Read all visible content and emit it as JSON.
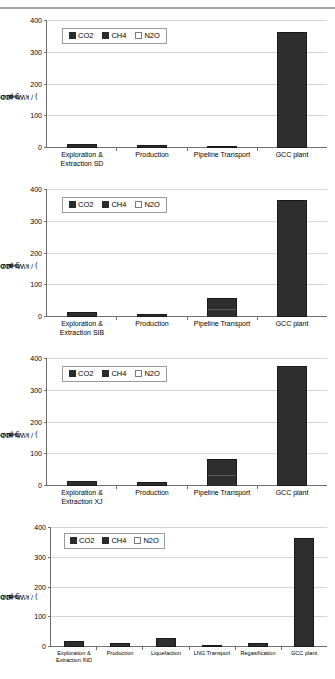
{
  "document": {
    "type": "figure-page",
    "background": "#ffffff",
    "artifact": "scan-line-top"
  },
  "axis": {
    "ylabel_pre": "g (CO",
    "ylabel_sub": "2",
    "ylabel_eq": "-equiv.",
    "ylabel_post": ") / kWh at busbar",
    "yticks": [
      "400",
      "300",
      "200",
      "100",
      "0"
    ],
    "ymin": 0,
    "ymax": 400
  },
  "legend": {
    "items": [
      {
        "label": "CO2",
        "marker": "filled-square",
        "color": "#2b2b2b"
      },
      {
        "label": "CH4",
        "marker": "filled-square",
        "color": "#2b2b2b"
      },
      {
        "label": "N2O",
        "marker": "open-square",
        "color": "#ffffff"
      }
    ]
  },
  "chart_data": [
    {
      "type": "bar",
      "id": "chart-sd",
      "title": "",
      "xlabel": "",
      "ylabel": "g (CO2-equiv.) / kWh at busbar",
      "ylim": [
        0,
        400
      ],
      "yticks": [
        0,
        100,
        200,
        300,
        400
      ],
      "grid": true,
      "legend": [
        "CO2",
        "CH4",
        "N2O"
      ],
      "legend_position": "upper-left",
      "categories": [
        "Exploration & Extraction SD",
        "Production",
        "Pipeline Transport",
        "GCC plant"
      ],
      "values": [
        8,
        6,
        2,
        360
      ],
      "series": [
        {
          "name": "CO2",
          "values": [
            4,
            4,
            1,
            359
          ]
        },
        {
          "name": "CH4",
          "values": [
            4,
            2,
            1,
            1
          ]
        },
        {
          "name": "N2O",
          "values": [
            0,
            0,
            0,
            0
          ]
        }
      ]
    },
    {
      "type": "bar",
      "id": "chart-sib",
      "title": "",
      "xlabel": "",
      "ylabel": "g (CO2-equiv.) / kWh at busbar",
      "ylim": [
        0,
        400
      ],
      "yticks": [
        0,
        100,
        200,
        300,
        400
      ],
      "grid": true,
      "legend": [
        "CO2",
        "CH4",
        "N2O"
      ],
      "legend_position": "upper-left",
      "categories": [
        "Exploration & Extraction SIB",
        "Production",
        "Pipeline Transport",
        "GCC plant"
      ],
      "values": [
        12,
        7,
        55,
        362
      ],
      "series": [
        {
          "name": "CO2",
          "values": [
            6,
            5,
            22,
            361
          ]
        },
        {
          "name": "CH4",
          "values": [
            6,
            2,
            33,
            1
          ]
        },
        {
          "name": "N2O",
          "values": [
            0,
            0,
            0,
            0
          ]
        }
      ]
    },
    {
      "type": "bar",
      "id": "chart-xj",
      "title": "",
      "xlabel": "",
      "ylabel": "g (CO2-equiv.) / kWh at busbar",
      "ylim": [
        0,
        400
      ],
      "yticks": [
        0,
        100,
        200,
        300,
        400
      ],
      "grid": true,
      "legend": [
        "CO2",
        "CH4",
        "N2O"
      ],
      "legend_position": "upper-left",
      "categories": [
        "Exploration & Extraction XJ",
        "Production",
        "Pipeline Transport",
        "GCC plant"
      ],
      "values": [
        13,
        9,
        80,
        372
      ],
      "series": [
        {
          "name": "CO2",
          "values": [
            7,
            6,
            33,
            371
          ]
        },
        {
          "name": "CH4",
          "values": [
            6,
            3,
            47,
            1
          ]
        },
        {
          "name": "N2O",
          "values": [
            0,
            0,
            0,
            0
          ]
        }
      ]
    },
    {
      "type": "bar",
      "id": "chart-ind-lng",
      "title": "",
      "xlabel": "",
      "ylabel": "g (CO2-equiv.) / kWh at busbar",
      "ylim": [
        0,
        400
      ],
      "yticks": [
        0,
        100,
        200,
        300,
        400
      ],
      "grid": true,
      "legend": [
        "CO2",
        "CH4",
        "N2O"
      ],
      "legend_position": "upper-left",
      "categories": [
        "Exploration & Extraction IND",
        "Production",
        "Liquefaction",
        "LNG Transport",
        "Regasification",
        "GCC plant"
      ],
      "values": [
        16,
        11,
        26,
        3,
        10,
        360
      ],
      "series": [
        {
          "name": "CO2",
          "values": [
            9,
            7,
            22,
            2,
            8,
            359
          ]
        },
        {
          "name": "CH4",
          "values": [
            7,
            4,
            4,
            1,
            2,
            1
          ]
        },
        {
          "name": "N2O",
          "values": [
            0,
            0,
            0,
            0,
            0,
            0
          ]
        }
      ]
    }
  ]
}
